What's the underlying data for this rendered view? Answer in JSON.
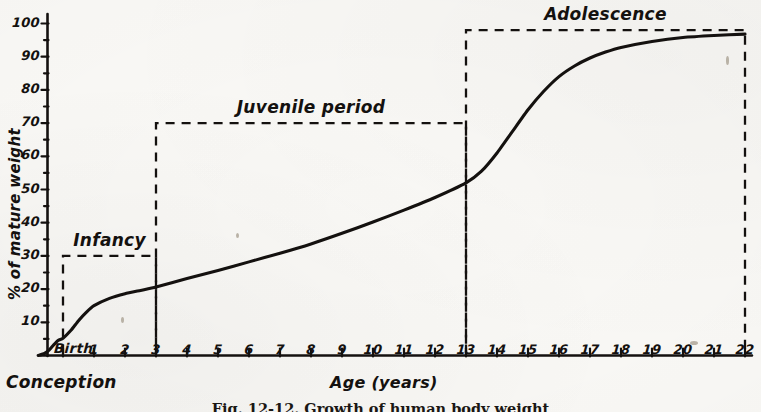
{
  "figure": {
    "caption": "Fig. 12-12.  Growth of human body weight",
    "background_color": "#fbfaf7",
    "ink_color": "#14110f"
  },
  "axes": {
    "y_title": "% of mature weight",
    "x_title": "Age (years)",
    "origin_label": "Conception",
    "birth_label": "Birth",
    "y_ticks": [
      "100",
      "90",
      "80",
      "70",
      "60",
      "50",
      "40",
      "30",
      "20",
      "10"
    ],
    "y_values": [
      100,
      90,
      80,
      70,
      60,
      50,
      40,
      30,
      20,
      10
    ],
    "x_ticks": [
      "1",
      "2",
      "3",
      "4",
      "5",
      "6",
      "7",
      "8",
      "9",
      "10",
      "11",
      "12",
      "13",
      "14",
      "15",
      "16",
      "17",
      "18",
      "19",
      "20",
      "21",
      "22"
    ]
  },
  "brackets": [
    {
      "label": "Infancy",
      "start_age": 0,
      "end_age": 3,
      "top_percent": 30
    },
    {
      "label": "Juvenile period",
      "start_age": 3,
      "end_age": 13,
      "top_percent": 70
    },
    {
      "label": "Adolescence",
      "start_age": 13,
      "end_age": 22,
      "top_percent": 98
    }
  ],
  "chart_data": {
    "type": "line",
    "title": "Growth of human body weight",
    "xlabel": "Age (years)",
    "ylabel": "% of mature weight",
    "xlim": [
      -0.8,
      22
    ],
    "ylim": [
      0,
      100
    ],
    "grid": false,
    "legend": "none",
    "x_tick_labels": [
      "Birth",
      "1",
      "2",
      "3",
      "4",
      "5",
      "6",
      "7",
      "8",
      "9",
      "10",
      "11",
      "12",
      "13",
      "14",
      "15",
      "16",
      "17",
      "18",
      "19",
      "20",
      "21",
      "22"
    ],
    "y_tick_values": [
      10,
      20,
      30,
      40,
      50,
      60,
      70,
      80,
      90,
      100
    ],
    "annotations": [
      "Conception",
      "Infancy",
      "Juvenile period",
      "Adolescence"
    ],
    "series": [
      {
        "name": "Body weight as % of mature weight",
        "x": [
          -0.8,
          -0.6,
          -0.45,
          -0.3,
          -0.15,
          0,
          0.25,
          0.5,
          0.75,
          1,
          1.5,
          2,
          2.5,
          3,
          4,
          5,
          6,
          7,
          8,
          9,
          10,
          11,
          12,
          13,
          13.5,
          14,
          14.5,
          15,
          15.5,
          16,
          16.5,
          17,
          17.5,
          18,
          19,
          20,
          21,
          22
        ],
        "y": [
          0,
          0.6,
          1.6,
          3.2,
          4.6,
          5.2,
          7.5,
          10.5,
          13.0,
          15.0,
          17.2,
          18.6,
          19.6,
          20.6,
          23.2,
          25.6,
          28.2,
          30.8,
          33.6,
          36.8,
          40.2,
          43.8,
          47.6,
          52.0,
          55.5,
          61.0,
          67.5,
          74.0,
          79.5,
          84.0,
          87.2,
          89.6,
          91.4,
          92.8,
          94.6,
          95.8,
          96.4,
          96.8
        ]
      }
    ]
  }
}
